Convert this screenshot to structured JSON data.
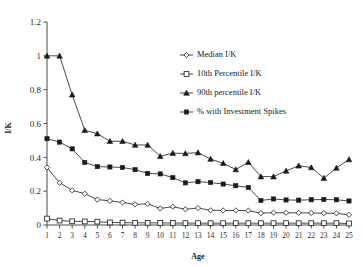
{
  "chart_data": {
    "type": "line",
    "title": "",
    "xlabel": "Age",
    "ylabel": "I/K",
    "xlim": [
      1,
      25
    ],
    "ylim": [
      0,
      1.2
    ],
    "yticks": [
      "0",
      "0.2",
      "0.4",
      "0.6",
      "0.8",
      "1",
      "1.2"
    ],
    "ytick_values": [
      0,
      0.2,
      0.4,
      0.6,
      0.8,
      1.0,
      1.2
    ],
    "grid": false,
    "legend_position": "upper-center-right",
    "categories": [
      1,
      2,
      3,
      4,
      5,
      6,
      7,
      8,
      9,
      10,
      11,
      12,
      13,
      14,
      15,
      16,
      17,
      18,
      19,
      20,
      21,
      22,
      23,
      24,
      25
    ],
    "xtick_labels": [
      "1",
      "2",
      "3",
      "4",
      "5",
      "6",
      "7",
      "8",
      "9",
      "10",
      "11",
      "12",
      "13",
      "14",
      "15",
      "16",
      "17",
      "18",
      "19",
      "20",
      "21",
      "22",
      "23",
      "24",
      "25"
    ],
    "series": [
      {
        "name": "Median I/K",
        "marker": "open-diamond",
        "values": [
          0.34,
          0.25,
          0.205,
          0.185,
          0.15,
          0.143,
          0.133,
          0.122,
          0.125,
          0.098,
          0.108,
          0.093,
          0.1,
          0.087,
          0.086,
          0.086,
          0.085,
          0.07,
          0.073,
          0.072,
          0.072,
          0.071,
          0.07,
          0.069,
          0.06
        ]
      },
      {
        "name": "10th Percentile I/K",
        "marker": "open-square",
        "values": [
          0.038,
          0.026,
          0.022,
          0.021,
          0.02,
          0.015,
          0.014,
          0.013,
          0.013,
          0.012,
          0.012,
          0.011,
          0.011,
          0.011,
          0.011,
          0.011,
          0.011,
          0.011,
          0.011,
          0.011,
          0.011,
          0.011,
          0.011,
          0.011,
          0.009
        ]
      },
      {
        "name": "90th percentile I/K",
        "marker": "solid-triangle",
        "values": [
          1.0,
          1.0,
          0.77,
          0.56,
          0.54,
          0.495,
          0.495,
          0.473,
          0.473,
          0.406,
          0.425,
          0.423,
          0.428,
          0.39,
          0.365,
          0.328,
          0.371,
          0.286,
          0.286,
          0.32,
          0.35,
          0.34,
          0.277,
          0.337,
          0.387
        ]
      },
      {
        "name": "% with Investment Spikes",
        "marker": "solid-square",
        "values": [
          0.51,
          0.49,
          0.45,
          0.37,
          0.345,
          0.343,
          0.34,
          0.327,
          0.305,
          0.302,
          0.28,
          0.249,
          0.256,
          0.251,
          0.242,
          0.232,
          0.222,
          0.145,
          0.154,
          0.148,
          0.147,
          0.149,
          0.151,
          0.149,
          0.142
        ]
      }
    ]
  },
  "legend": {
    "items": [
      {
        "label": "Median I/K"
      },
      {
        "label": "10th Percentile I/K"
      },
      {
        "label": "90th percentile I/K"
      },
      {
        "label": "% with Investment Spikes"
      }
    ]
  },
  "colors": {
    "line": "#1a1a1a",
    "axis": "#4a4a4a",
    "background": "#ffffff"
  }
}
